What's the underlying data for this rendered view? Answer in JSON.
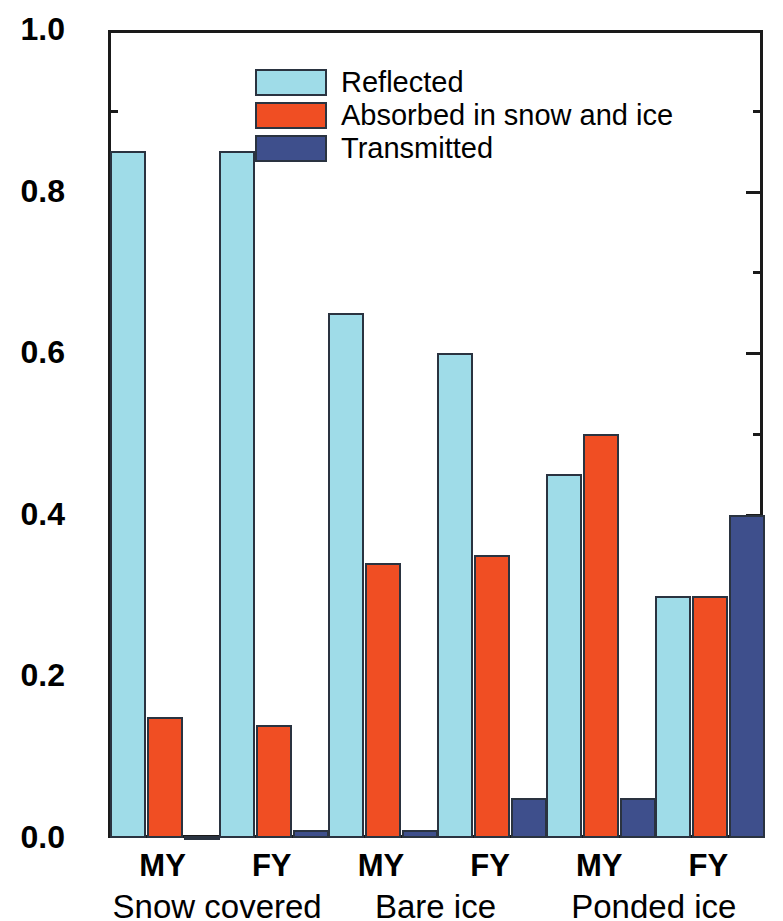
{
  "chart_data": {
    "type": "bar",
    "title": "",
    "xlabel": "",
    "ylabel": "Fraction",
    "ylim": [
      0.0,
      1.0
    ],
    "y_ticks": [
      "0.0",
      "0.2",
      "0.4",
      "0.6",
      "0.8",
      "1.0"
    ],
    "y_tick_values": [
      0.0,
      0.2,
      0.4,
      0.6,
      0.8,
      1.0
    ],
    "grid": false,
    "legend_position": "top-center",
    "groups": [
      {
        "label": "Snow covered",
        "subgroups": [
          "MY",
          "FY"
        ]
      },
      {
        "label": "Bare ice",
        "subgroups": [
          "MY",
          "FY"
        ]
      },
      {
        "label": "Ponded ice",
        "subgroups": [
          "MY",
          "FY"
        ]
      }
    ],
    "categories": [
      "Snow covered MY",
      "Snow covered FY",
      "Bare ice MY",
      "Bare ice FY",
      "Ponded ice MY",
      "Ponded ice FY"
    ],
    "series": [
      {
        "name": "Reflected",
        "color": "#9FDCE8",
        "values": [
          0.85,
          0.85,
          0.65,
          0.6,
          0.45,
          0.3
        ]
      },
      {
        "name": "Absorbed in snow and ice",
        "color": "#F04E23",
        "values": [
          0.15,
          0.14,
          0.34,
          0.35,
          0.5,
          0.3
        ]
      },
      {
        "name": "Transmitted",
        "color": "#3E4F8C",
        "values": [
          0.002,
          0.01,
          0.01,
          0.05,
          0.05,
          0.4
        ]
      }
    ]
  },
  "axis": {
    "y_title": "Fraction"
  },
  "legend": {
    "items": [
      {
        "label": "Reflected",
        "color": "#9FDCE8"
      },
      {
        "label": "Absorbed in snow and ice",
        "color": "#F04E23"
      },
      {
        "label": "Transmitted",
        "color": "#3E4F8C"
      }
    ]
  },
  "style": {
    "reflected_color": "#9FDCE8",
    "absorbed_color": "#F04E23",
    "transmitted_color": "#3E4F8C",
    "frame_color": "#1a1a1a",
    "background": "#ffffff"
  }
}
